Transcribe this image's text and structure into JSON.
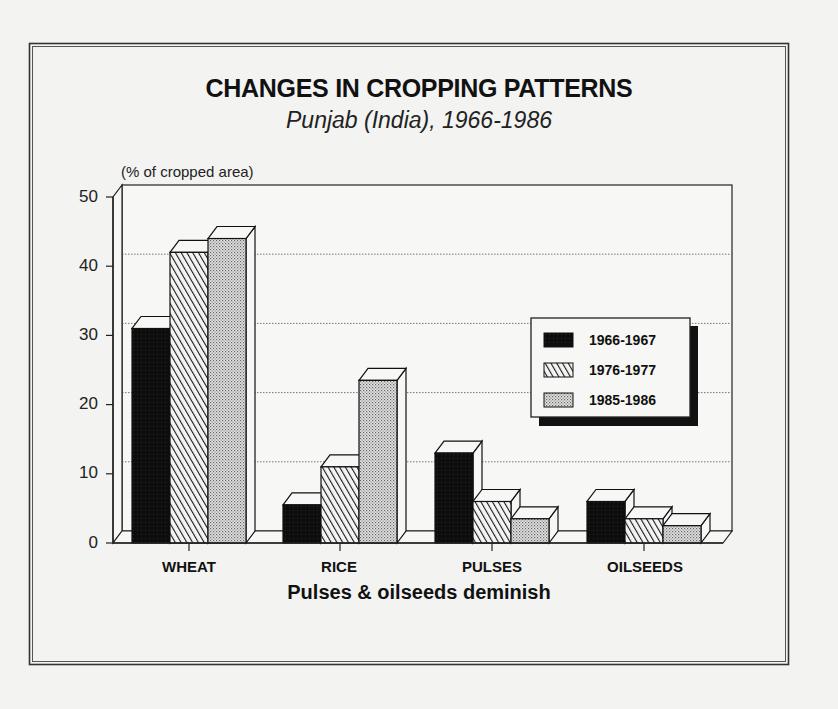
{
  "chart_data": {
    "type": "bar",
    "title": "CHANGES IN CROPPING PATTERNS",
    "subtitle": "Punjab (India), 1966-1986",
    "ylabel": "(% of cropped area)",
    "xlabel": "Pulses & oilseeds deminish",
    "categories": [
      "WHEAT",
      "RICE",
      "PULSES",
      "OILSEEDS"
    ],
    "series": [
      {
        "name": "1966-1967",
        "pattern": "solid-black",
        "values": [
          31,
          5.5,
          13,
          6
        ]
      },
      {
        "name": "1976-1977",
        "pattern": "diagonal-hatch",
        "values": [
          42,
          11,
          6,
          3.5
        ]
      },
      {
        "name": "1985-1986",
        "pattern": "dotted-stipple",
        "values": [
          44,
          23.5,
          3.5,
          2.5
        ]
      }
    ],
    "ylim": [
      0,
      50
    ],
    "yticks": [
      0,
      10,
      20,
      30,
      40,
      50
    ],
    "grid": true,
    "legend_position": "right-center",
    "style": "3d-bar"
  },
  "colors": {
    "background": "#f3f3f1",
    "ink": "#111111",
    "series_1": "#0d0d0d",
    "series_2_stripe": "#222222",
    "series_3_dot": "#555555"
  }
}
